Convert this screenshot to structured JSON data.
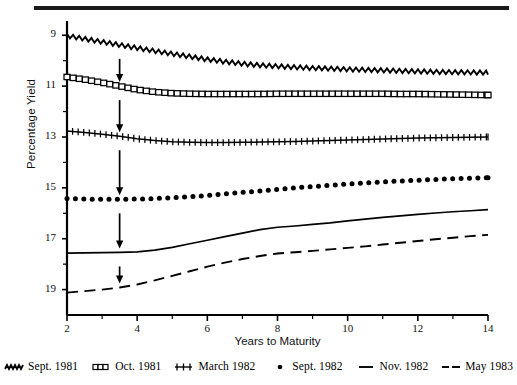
{
  "chart_data": {
    "type": "line",
    "title": "",
    "xlabel": "Years to Maturity",
    "ylabel": "Percentage Yield",
    "xlim": [
      2,
      14
    ],
    "ylim": [
      8,
      19.6
    ],
    "xticks": [
      2,
      4,
      6,
      8,
      10,
      12,
      14
    ],
    "xticks_minor": [
      3,
      5,
      7,
      9,
      11,
      13
    ],
    "yticks": [
      9,
      11,
      13,
      15,
      17,
      19
    ],
    "yticks_minor": [
      10,
      12,
      14,
      16,
      18
    ],
    "grid": false,
    "legend_position": "below",
    "annotations": [
      {
        "type": "arrow",
        "x": 3.5,
        "direction": "down",
        "target_series": "Sept. 1981"
      },
      {
        "type": "arrow",
        "x": 3.5,
        "direction": "down",
        "target_series": "Oct. 1981"
      },
      {
        "type": "arrow",
        "x": 3.5,
        "direction": "down",
        "target_series": "March 1982"
      },
      {
        "type": "arrow",
        "x": 3.5,
        "direction": "down",
        "target_series": "Sept. 1982"
      },
      {
        "type": "arrow",
        "x": 3.5,
        "direction": "down",
        "target_series": "Nov. 1982"
      },
      {
        "type": "arrow",
        "x": 3.5,
        "direction": "down",
        "target_series": "May 1983"
      }
    ],
    "x": [
      2,
      2.5,
      3,
      3.5,
      4,
      4.5,
      5,
      5.5,
      6,
      6.5,
      7,
      7.5,
      8,
      8.5,
      9,
      9.5,
      10,
      10.5,
      11,
      11.5,
      12,
      12.5,
      13,
      13.5,
      14
    ],
    "series": [
      {
        "name": "Sept. 1981",
        "marker": "zigzag",
        "values": [
          18.98,
          18.86,
          18.74,
          18.62,
          18.5,
          18.38,
          18.27,
          18.16,
          18.05,
          17.96,
          17.88,
          17.82,
          17.78,
          17.74,
          17.71,
          17.69,
          17.66,
          17.64,
          17.62,
          17.6,
          17.58,
          17.56,
          17.55,
          17.54,
          17.53
        ]
      },
      {
        "name": "Oct. 1981",
        "marker": "boxes",
        "values": [
          17.36,
          17.26,
          17.14,
          17.0,
          16.86,
          16.77,
          16.72,
          16.7,
          16.69,
          16.69,
          16.69,
          16.69,
          16.7,
          16.7,
          16.7,
          16.7,
          16.7,
          16.7,
          16.7,
          16.69,
          16.69,
          16.68,
          16.67,
          16.66,
          16.65
        ]
      },
      {
        "name": "March 1982",
        "marker": "plus-ticks",
        "values": [
          15.24,
          15.18,
          15.11,
          15.03,
          14.93,
          14.86,
          14.81,
          14.79,
          14.78,
          14.78,
          14.79,
          14.8,
          14.81,
          14.82,
          14.84,
          14.86,
          14.88,
          14.9,
          14.92,
          14.94,
          14.96,
          14.97,
          14.98,
          14.99,
          15.0
        ]
      },
      {
        "name": "Sept. 1982",
        "marker": "dots",
        "values": [
          12.58,
          12.56,
          12.55,
          12.55,
          12.56,
          12.58,
          12.61,
          12.65,
          12.7,
          12.76,
          12.82,
          12.88,
          12.94,
          13.0,
          13.05,
          13.1,
          13.15,
          13.19,
          13.23,
          13.27,
          13.3,
          13.33,
          13.36,
          13.38,
          13.4
        ]
      },
      {
        "name": "Nov. 1982",
        "marker": "solid",
        "values": [
          10.43,
          10.44,
          10.45,
          10.46,
          10.48,
          10.55,
          10.66,
          10.8,
          10.94,
          11.08,
          11.22,
          11.36,
          11.45,
          11.5,
          11.56,
          11.62,
          11.7,
          11.77,
          11.84,
          11.9,
          11.96,
          12.01,
          12.06,
          12.1,
          12.14
        ]
      },
      {
        "name": "May 1983",
        "marker": "dashed",
        "values": [
          8.88,
          8.94,
          9.0,
          9.08,
          9.2,
          9.36,
          9.54,
          9.72,
          9.9,
          10.06,
          10.2,
          10.32,
          10.42,
          10.47,
          10.52,
          10.58,
          10.64,
          10.7,
          10.77,
          10.84,
          10.91,
          10.98,
          11.04,
          11.1,
          11.15
        ]
      }
    ]
  },
  "axes": {
    "ylabel": "Percentage Yield",
    "xlabel": "Years to Maturity",
    "ytick_labels": [
      "19",
      "17",
      "15",
      "13",
      "11",
      "9"
    ],
    "xtick_labels": [
      "2",
      "4",
      "6",
      "8",
      "10",
      "12",
      "14"
    ]
  },
  "legend": {
    "items": [
      {
        "label": "Sept. 1981",
        "glyph": "zigzag-glyph"
      },
      {
        "label": "Oct. 1981",
        "glyph": "boxes-glyph"
      },
      {
        "label": "March 1982",
        "glyph": "plus-ticks-glyph"
      },
      {
        "label": "Sept. 1982",
        "glyph": "dot-glyph"
      },
      {
        "label": "Nov. 1982",
        "glyph": "solid-line-glyph"
      },
      {
        "label": "May 1983",
        "glyph": "dashed-line-glyph"
      }
    ]
  },
  "colors": {
    "ink": "#000000",
    "rule": "#1a1a1a",
    "background": "#ffffff"
  }
}
